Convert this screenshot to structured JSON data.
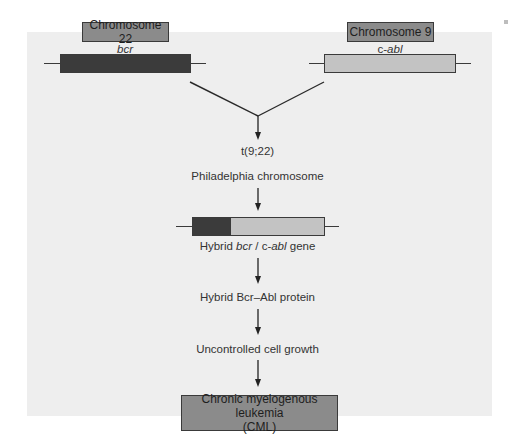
{
  "diagram": {
    "type": "flowchart",
    "chromosomes": [
      {
        "label": "Chromosome 22",
        "gene": "bcr",
        "gene_italic": true,
        "bar_color": "#3b3b3b"
      },
      {
        "label": "Chromosome 9",
        "gene_prefix": "c-",
        "gene_italic_part": "abl",
        "bar_color": "#c3c3c3"
      }
    ],
    "hybrid_gene": {
      "segments": [
        {
          "name": "bcr",
          "color": "#3b3b3b",
          "fraction": 0.29
        },
        {
          "name": "c-abl",
          "color": "#c3c3c3",
          "fraction": 0.71
        }
      ]
    },
    "steps": {
      "translocation": "t(9;22)",
      "philadelphia": "Philadelphia chromosome",
      "hybrid_gene_label": {
        "pre": "Hybrid ",
        "bcr": "bcr",
        "sep": " / c-",
        "abl": "abl",
        "post": " gene"
      },
      "protein": "Hybrid Bcr–Abl protein",
      "growth": "Uncontrolled cell growth"
    },
    "outcome": {
      "line1": "Chronic myelogenous leukemia",
      "line2": "(CML)"
    },
    "colors": {
      "panel_background": "#eeeeee",
      "label_box": "#8b8b8b",
      "dark_gene": "#3b3b3b",
      "light_gene": "#c3c3c3",
      "line": "#2a2a2a"
    }
  }
}
